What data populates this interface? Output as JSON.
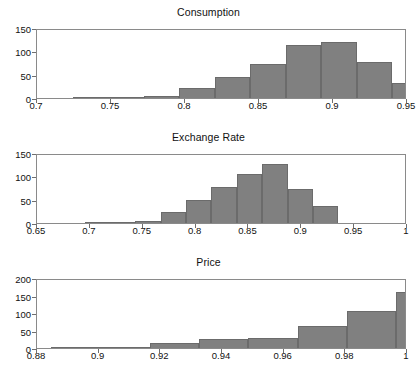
{
  "figure": {
    "background": "#ffffff",
    "bar_fill": "#808080",
    "bar_edge": "#6b6b6b",
    "axis_color": "#8a8a8a",
    "text_color": "#111111"
  },
  "chart_data": [
    {
      "type": "bar",
      "title": "Consumption",
      "xlabel": "",
      "ylabel": "",
      "xlim": [
        0.7,
        0.95
      ],
      "ylim": [
        0,
        150
      ],
      "grid": false,
      "legend": "none",
      "xticks": [
        0.7,
        0.75,
        0.8,
        0.85,
        0.9,
        0.95
      ],
      "xtick_labels": [
        "0.7",
        "0.75",
        "0.8",
        "0.85",
        "0.9",
        "0.95"
      ],
      "yticks": [
        0,
        50,
        100,
        150
      ],
      "ytick_labels": [
        "0",
        "50",
        "100",
        "150"
      ],
      "bin_edges": [
        0.724,
        0.748,
        0.772,
        0.796,
        0.82,
        0.844,
        0.868,
        0.892,
        0.916,
        0.94
      ],
      "values": [
        1,
        3,
        5,
        22,
        46,
        73,
        114,
        121,
        77,
        33
      ],
      "categories": [
        "0.724-0.748",
        "0.748-0.772",
        "0.772-0.796",
        "0.796-0.820",
        "0.820-0.844",
        "0.844-0.868",
        "0.868-0.892",
        "0.892-0.916",
        "0.916-0.940",
        "0.940-0.964"
      ]
    },
    {
      "type": "bar",
      "title": "Exchange Rate",
      "xlabel": "",
      "ylabel": "",
      "xlim": [
        0.65,
        1.0
      ],
      "ylim": [
        0,
        150
      ],
      "grid": false,
      "legend": "none",
      "xticks": [
        0.65,
        0.7,
        0.75,
        0.8,
        0.85,
        0.9,
        0.95,
        1.0
      ],
      "xtick_labels": [
        "0.65",
        "0.7",
        "0.75",
        "0.8",
        "0.85",
        "0.9",
        "0.95",
        "1"
      ],
      "yticks": [
        0,
        50,
        100,
        150
      ],
      "ytick_labels": [
        "0",
        "50",
        "100",
        "150"
      ],
      "bin_edges": [
        0.695,
        0.719,
        0.743,
        0.767,
        0.791,
        0.815,
        0.839,
        0.863,
        0.887,
        0.911,
        0.935
      ],
      "values": [
        2,
        2,
        5,
        23,
        49,
        77,
        106,
        126,
        73,
        36
      ],
      "categories": [
        "0.695-0.719",
        "0.719-0.743",
        "0.743-0.767",
        "0.767-0.791",
        "0.791-0.815",
        "0.815-0.839",
        "0.839-0.863",
        "0.863-0.887",
        "0.887-0.911",
        "0.911-0.935"
      ]
    },
    {
      "type": "bar",
      "title": "Price",
      "xlabel": "",
      "ylabel": "",
      "xlim": [
        0.88,
        1.0
      ],
      "ylim": [
        0,
        200
      ],
      "grid": false,
      "legend": "none",
      "xticks": [
        0.88,
        0.9,
        0.92,
        0.94,
        0.96,
        0.98,
        1.0
      ],
      "xtick_labels": [
        "0.88",
        "0.9",
        "0.92",
        "0.94",
        "0.96",
        "0.98",
        "1"
      ],
      "yticks": [
        0,
        50,
        100,
        150,
        200
      ],
      "ytick_labels": [
        "0",
        "50",
        "100",
        "150",
        "200"
      ],
      "bin_edges": [
        0.8845,
        0.9005,
        0.9165,
        0.9325,
        0.9485,
        0.9645,
        0.9805,
        0.9965
      ],
      "values": [
        4,
        4,
        13,
        27,
        30,
        62,
        106,
        159,
        95
      ],
      "categories": [
        "0.8845-0.8965",
        "0.8965-0.9085",
        "0.9085-0.9205",
        "0.9205-0.9325",
        "0.9325-0.9445",
        "0.9445-0.9565",
        "0.9565-0.9685",
        "0.9685-0.9805",
        "0.9805-0.9925"
      ]
    }
  ]
}
